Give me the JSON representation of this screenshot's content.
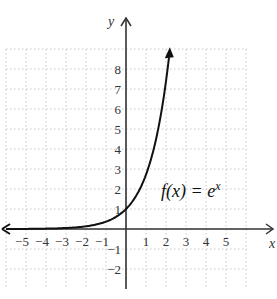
{
  "chart_data": {
    "type": "line",
    "title": "",
    "xlabel": "x",
    "ylabel": "y",
    "xlim": [
      -6,
      6
    ],
    "ylim": [
      -3,
      9
    ],
    "grid": true,
    "x_ticks": [
      "-5",
      "-4",
      "-3",
      "-2",
      "-1",
      "1",
      "2",
      "3",
      "4",
      "5"
    ],
    "y_ticks": [
      "8",
      "7",
      "6",
      "5",
      "4",
      "3",
      "2",
      "1",
      "-1",
      "-2"
    ],
    "series": [
      {
        "name": "f(x) = e^x",
        "function": "e^x",
        "x": [
          -6,
          -5,
          -4,
          -3,
          -2,
          -1,
          0,
          0.5,
          1,
          1.5,
          2,
          2.2
        ],
        "y": [
          0.0025,
          0.0067,
          0.018,
          0.05,
          0.135,
          0.368,
          1,
          1.65,
          2.72,
          4.48,
          7.39,
          9.03
        ]
      }
    ],
    "annotations": [
      {
        "text_main": "f(x) = e",
        "text_sup": "x",
        "x": 2,
        "y": 2
      }
    ]
  },
  "labels": {
    "x_axis": "x",
    "y_axis": "y",
    "function_main": "f(x) = e",
    "function_sup": "x"
  }
}
